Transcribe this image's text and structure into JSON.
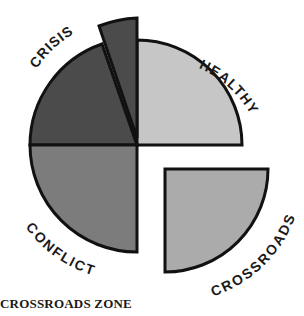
{
  "diagram": {
    "type": "exploded-quadrant-circle",
    "segments": [
      {
        "name": "healthy",
        "label": "HEALTHY",
        "color": "#c4c4c4"
      },
      {
        "name": "crossroads",
        "label": "CROSSROADS",
        "color": "#a9a9a9",
        "exploded": true
      },
      {
        "name": "conflict",
        "label": "CONFLICT",
        "color": "#7a7a7a"
      },
      {
        "name": "crisis",
        "label": "CRISIS",
        "color": "#4a4a4a"
      },
      {
        "name": "crisis-wedge",
        "label": "",
        "color": "#4a4a4a",
        "exploded": true
      }
    ],
    "outline_color": "#111111"
  },
  "caption": "CROSSROADS ZONE"
}
